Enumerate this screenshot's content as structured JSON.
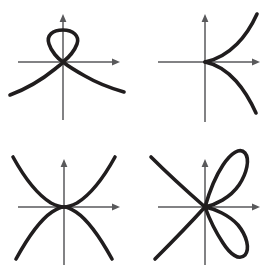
{
  "figure": {
    "background_color": "#ffffff",
    "axis_color": "#59595b",
    "curve_color": "#201d1e",
    "layout": "2x2 grid of coordinate plots",
    "panel_count": 4
  },
  "panels": [
    {
      "id": "panel-node",
      "name": "node-with-loop",
      "position": "top-left",
      "description": "Curve with a loop above the x-axis crossing itself at the origin (node), with two branches descending to the left and right",
      "origin": {
        "x": 63,
        "y": 62
      },
      "axes": {
        "x_axis": {
          "from_x": 18,
          "to_x": 118,
          "y": 62,
          "arrow": "right"
        },
        "y_axis": {
          "from_y": 120,
          "to_y": 15,
          "x": 63,
          "arrow": "up"
        }
      },
      "singularity": "node (ordinary double point)"
    },
    {
      "id": "panel-cusp",
      "name": "cusp-opening-right",
      "position": "top-right",
      "description": "Semicubical parabola with a cusp at the origin, two branches opening to the right, one rising and one falling",
      "origin": {
        "x": 205,
        "y": 62
      },
      "axes": {
        "x_axis": {
          "from_x": 158,
          "to_x": 258,
          "y": 62,
          "arrow": "right"
        },
        "y_axis": {
          "from_y": 122,
          "to_y": 15,
          "x": 205,
          "arrow": "up"
        }
      },
      "singularity": "cusp"
    },
    {
      "id": "panel-tacnode",
      "name": "tacnode-tangent-branches",
      "position": "bottom-left",
      "description": "Two parabola-like branches tangent to each other at the origin, one opening upward and one opening downward",
      "origin": {
        "x": 64,
        "y": 207
      },
      "axes": {
        "x_axis": {
          "from_x": 18,
          "to_x": 118,
          "y": 207,
          "arrow": "right"
        },
        "y_axis": {
          "from_y": 265,
          "to_y": 160,
          "x": 64,
          "arrow": "up"
        }
      },
      "singularity": "tacnode (tangential double point)"
    },
    {
      "id": "panel-rose",
      "name": "two-petal-rose-with-line",
      "position": "bottom-right",
      "description": "Two elongated petals through the origin, one in the upper-right and one in the lower-right, plus a straight branch running from upper-left to lower-left through the origin",
      "origin": {
        "x": 205,
        "y": 207
      },
      "axes": {
        "x_axis": {
          "from_x": 158,
          "to_x": 258,
          "y": 207,
          "arrow": "right"
        },
        "y_axis": {
          "from_y": 265,
          "to_y": 160,
          "x": 205,
          "arrow": "up"
        }
      },
      "singularity": "multiple point of order three"
    }
  ]
}
